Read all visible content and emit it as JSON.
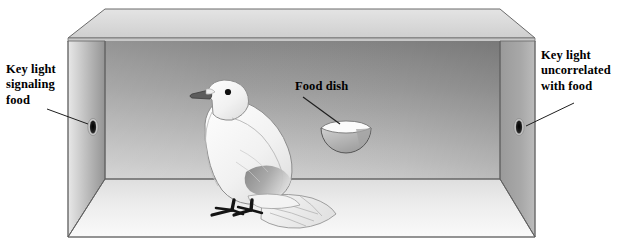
{
  "figure": {
    "width": 625,
    "height": 248,
    "background_color": "#ffffff"
  },
  "labels": {
    "left_key_light": "Key light\nsignaling\nfood",
    "right_key_light": "Key light\nuncorrelated\nwith food",
    "food_dish": "Food dish"
  },
  "colors": {
    "outline": "#4d4d4d",
    "outline_dark": "#3a3a3a",
    "top_panel": "#d9d9d9",
    "top_panel_edge": "#c4c4c4",
    "back_wall_top": "#8e8e8e",
    "back_wall_bottom": "#c9c9c9",
    "left_wall_light": "#e4e4e4",
    "left_wall_dark": "#9a9a9a",
    "right_wall": "#9d9d9d",
    "floor_light": "#f2f2f2",
    "floor_dark": "#dcdcdc",
    "bird_body": "#f4f4f4",
    "bird_shade": "#dadada",
    "bird_wing_patch": "#8f8f8f",
    "bird_beak": "#5a5a5a",
    "bird_eye": "#111111",
    "bird_feet": "#1a1a1a",
    "dish_bowl": "#b6b6b6",
    "dish_rim": "#fbfbfb",
    "key_light_hole": "#1e1e1e",
    "key_light_ring": "#cfcfcf",
    "label_text": "#000000",
    "leader_line": "#2b2b2b"
  },
  "elements": {
    "chamber": "three-dimensional rectangular operant chamber drawn in perspective",
    "left_key_light": "small dark oval aperture on left interior wall",
    "right_key_light": "small dark oval aperture on right interior wall",
    "food_dish": "hemispherical dish mounted on the back wall",
    "pigeon": "white pigeon standing on the chamber floor facing left"
  },
  "pigeon": {
    "description": "white pigeon with gray wing patch, dark beak, black eye, black legs and fanned tail",
    "facing": "left"
  }
}
